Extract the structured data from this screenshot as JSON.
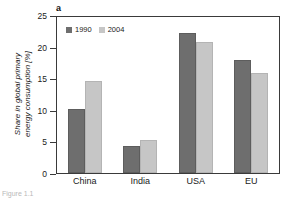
{
  "figure": {
    "panel_letter": "a",
    "caption_fragment": "Figure 1.1"
  },
  "chart_data": {
    "type": "bar",
    "title": "",
    "xlabel": "",
    "ylabel": "Share in global primary energy consumption [%]",
    "ylabel_lines": [
      "Share in global primary",
      "energy consumption [%]"
    ],
    "categories": [
      "China",
      "India",
      "USA",
      "EU"
    ],
    "series": [
      {
        "name": "1990",
        "values": [
          10.1,
          4.2,
          22.2,
          17.9
        ],
        "color": "#6e6e6e"
      },
      {
        "name": "2004",
        "values": [
          14.5,
          5.2,
          20.8,
          15.9
        ],
        "color": "#c6c6c6"
      }
    ],
    "ylim": [
      0,
      25
    ],
    "yticks": [
      0,
      5,
      10,
      15,
      20,
      25
    ],
    "ytick_labels": [
      "0",
      "5",
      "10",
      "15",
      "20",
      "25"
    ],
    "grid": false,
    "legend_position": "top-left",
    "frame": true
  }
}
